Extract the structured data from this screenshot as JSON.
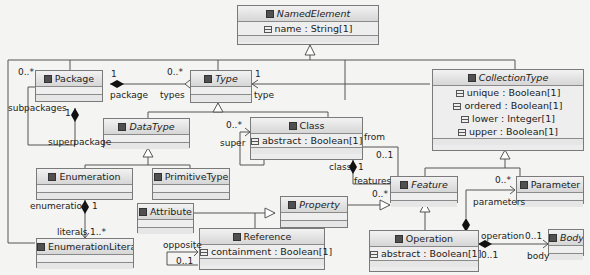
{
  "classes": {
    "named_element": {
      "name": "NamedElement",
      "abstract": true,
      "attrs": [
        "name : String[1]"
      ]
    },
    "package": {
      "name": "Package",
      "abstract": false,
      "attrs": []
    },
    "type": {
      "name": "Type",
      "abstract": true,
      "attrs": []
    },
    "collection_type": {
      "name": "CollectionType",
      "abstract": true,
      "attrs": [
        "unique : Boolean[1]",
        "ordered : Boolean[1]",
        "lower : Integer[1]",
        "upper : Boolean[1]"
      ]
    },
    "data_type": {
      "name": "DataType",
      "abstract": true,
      "attrs": []
    },
    "class": {
      "name": "Class",
      "abstract": false,
      "attrs": [
        "abstract : Boolean[1]"
      ]
    },
    "enumeration": {
      "name": "Enumeration",
      "abstract": false,
      "attrs": []
    },
    "primitive_type": {
      "name": "PrimitiveType",
      "abstract": false,
      "attrs": []
    },
    "attribute": {
      "name": "Attribute",
      "abstract": false,
      "attrs": []
    },
    "property": {
      "name": "Property",
      "abstract": true,
      "attrs": []
    },
    "feature": {
      "name": "Feature",
      "abstract": true,
      "attrs": []
    },
    "parameter": {
      "name": "Parameter",
      "abstract": false,
      "attrs": []
    },
    "enumeration_literal": {
      "name": "EnumerationLiteral",
      "abstract": false,
      "attrs": []
    },
    "reference": {
      "name": "Reference",
      "abstract": false,
      "attrs": [
        "containment : Boolean[1]"
      ]
    },
    "operation": {
      "name": "Operation",
      "abstract": false,
      "attrs": [
        "abstract : Boolean[1]"
      ]
    },
    "body": {
      "name": "Body",
      "abstract": true,
      "attrs": []
    }
  },
  "labels": {
    "package_mult": "0..*",
    "package_one": "1",
    "package_role": "package",
    "types_mult": "0..*",
    "types_role": "types",
    "type_one": "1",
    "type_role": "type",
    "subpackages": "subpackages",
    "superpackage_one": "1",
    "superpackage": "superpackage",
    "super_mult": "0..*",
    "super": "super",
    "from": "from",
    "from_mult": "0..1",
    "class_role": "class",
    "class_one": "1",
    "features": "features",
    "features_mult": "0..*",
    "enumeration_role": "enumeration",
    "enumeration_one": "1",
    "literals": "literals",
    "literals_mult": "1..*",
    "opposite": "opposite",
    "opposite_mult": "0..1",
    "parameters_mult": "0..*",
    "parameters": "parameters",
    "operation_role": "operation",
    "operation_mult": "0..1",
    "body_mult": "0..1",
    "body_role": "body"
  }
}
